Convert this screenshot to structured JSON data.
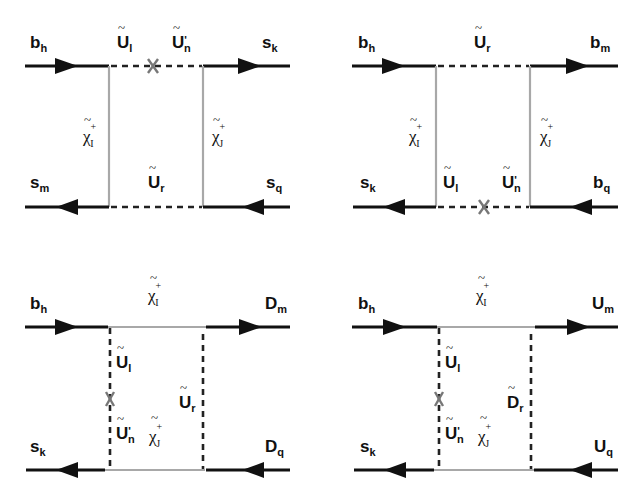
{
  "figure": {
    "colors": {
      "fermion_line": "#111111",
      "chargino_line": "#a8a8a8",
      "squark_line": "#222222",
      "mass_insertion": "#777777"
    },
    "diagrams": [
      {
        "id": "top-left",
        "external": {
          "in_top": {
            "base": "b",
            "sub": "h"
          },
          "out_top": {
            "base": "s",
            "sub": "k"
          },
          "out_bottom": {
            "base": "s",
            "sub": "m"
          },
          "in_bottom": {
            "base": "s",
            "sub": "q"
          }
        },
        "internal": {
          "top_left": {
            "base": "U",
            "sub": "l",
            "prime": ""
          },
          "top_right": {
            "base": "U",
            "sub": "n",
            "prime": "'"
          },
          "bottom": {
            "base": "U",
            "sub": "r",
            "prime": ""
          },
          "left": {
            "base": "χ",
            "sub": "I",
            "sup": "+"
          },
          "right": {
            "base": "χ",
            "sub": "J",
            "sup": "+"
          }
        },
        "mass_insertion": "top"
      },
      {
        "id": "top-right",
        "external": {
          "in_top": {
            "base": "b",
            "sub": "h"
          },
          "out_top": {
            "base": "b",
            "sub": "m"
          },
          "out_bottom": {
            "base": "s",
            "sub": "k"
          },
          "in_bottom": {
            "base": "b",
            "sub": "q"
          }
        },
        "internal": {
          "top": {
            "base": "U",
            "sub": "r",
            "prime": ""
          },
          "bottom_left": {
            "base": "U",
            "sub": "l",
            "prime": ""
          },
          "bottom_right": {
            "base": "U",
            "sub": "n",
            "prime": "'"
          },
          "left": {
            "base": "χ",
            "sub": "I",
            "sup": "+"
          },
          "right": {
            "base": "χ",
            "sub": "J",
            "sup": "+"
          }
        },
        "mass_insertion": "bottom"
      },
      {
        "id": "bottom-left",
        "external": {
          "in_top": {
            "base": "b",
            "sub": "h"
          },
          "out_top": {
            "base": "D",
            "sub": "m"
          },
          "out_bottom": {
            "base": "s",
            "sub": "k"
          },
          "in_bottom": {
            "base": "D",
            "sub": "q"
          }
        },
        "internal": {
          "top": {
            "base": "χ",
            "sub": "I",
            "sup": "+"
          },
          "bottom": {
            "base": "χ",
            "sub": "J",
            "sup": "+"
          },
          "left_upper": {
            "base": "U",
            "sub": "l",
            "prime": ""
          },
          "left_lower": {
            "base": "U",
            "sub": "n",
            "prime": "'"
          },
          "right": {
            "base": "U",
            "sub": "r",
            "prime": ""
          }
        },
        "mass_insertion": "left"
      },
      {
        "id": "bottom-right",
        "external": {
          "in_top": {
            "base": "b",
            "sub": "h"
          },
          "out_top": {
            "base": "U",
            "sub": "m"
          },
          "out_bottom": {
            "base": "s",
            "sub": "k"
          },
          "in_bottom": {
            "base": "U",
            "sub": "q"
          }
        },
        "internal": {
          "top": {
            "base": "χ",
            "sub": "I",
            "sup": "+"
          },
          "bottom": {
            "base": "χ",
            "sub": "J",
            "sup": "+"
          },
          "left_upper": {
            "base": "U",
            "sub": "l",
            "prime": ""
          },
          "left_lower": {
            "base": "U",
            "sub": "n",
            "prime": "'"
          },
          "right": {
            "base": "D",
            "sub": "r",
            "prime": ""
          }
        },
        "mass_insertion": "left"
      }
    ]
  }
}
